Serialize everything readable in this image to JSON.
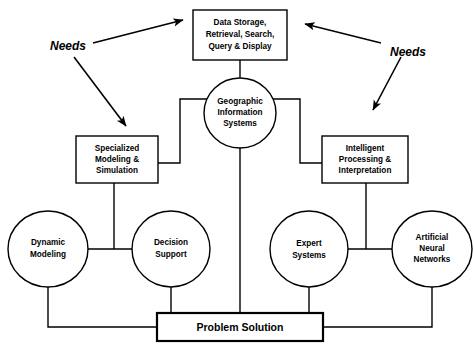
{
  "diagram": {
    "background_color": "#ffffff",
    "line_color": "#000000",
    "nodes": {
      "data_storage": {
        "shape": "rectangle",
        "lines": [
          "Data Storage,",
          "Retrieval, Search,",
          "Query & Display"
        ]
      },
      "gis": {
        "shape": "circle",
        "lines": [
          "Geographic",
          "Information",
          "Systems"
        ]
      },
      "specialized_modeling": {
        "shape": "rectangle",
        "lines": [
          "Specialized",
          "Modeling &",
          "Simulation"
        ]
      },
      "intelligent_processing": {
        "shape": "rectangle",
        "lines": [
          "Intelligent",
          "Processing &",
          "Interpretation"
        ]
      },
      "dynamic_modeling": {
        "shape": "circle",
        "lines": [
          "Dynamic",
          "Modeling"
        ]
      },
      "decision_support": {
        "shape": "circle",
        "lines": [
          "Decision",
          "Support"
        ]
      },
      "expert_systems": {
        "shape": "circle",
        "lines": [
          "Expert",
          "Systems"
        ]
      },
      "artificial_neural_networks": {
        "shape": "circle",
        "lines": [
          "Artificial",
          "Neural",
          "Networks"
        ]
      },
      "problem_solution": {
        "shape": "rectangle",
        "lines": [
          "Problem Solution"
        ]
      }
    },
    "annotations": {
      "needs_left": "Needs",
      "needs_right": "Needs"
    }
  }
}
